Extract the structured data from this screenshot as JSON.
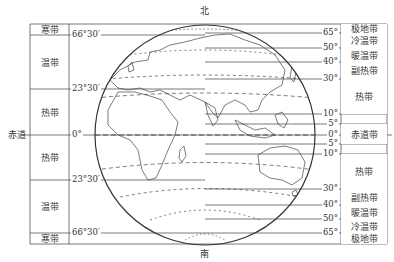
{
  "title": {
    "north": "北",
    "south": "南"
  },
  "equator_label": "赤道",
  "left_table": {
    "lines": [
      {
        "label": "66°30′",
        "y": 35
      },
      {
        "label": "23°30′",
        "y": 89
      },
      {
        "label": "0°",
        "y": 135
      },
      {
        "label": "23°30′",
        "y": 180
      },
      {
        "label": "66°30′",
        "y": 233
      }
    ],
    "zones": [
      {
        "label": "寒带",
        "y0": 24,
        "y1": 35
      },
      {
        "label": "温带",
        "y0": 35,
        "y1": 89
      },
      {
        "label": "热带",
        "y0": 89,
        "y1": 135
      },
      {
        "label": "热带",
        "y0": 135,
        "y1": 180
      },
      {
        "label": "温带",
        "y0": 180,
        "y1": 233
      },
      {
        "label": "寒带",
        "y0": 233,
        "y1": 244
      }
    ]
  },
  "right_table": {
    "lines": [
      {
        "label": "65°",
        "y": 33
      },
      {
        "label": "50°",
        "y": 48
      },
      {
        "label": "40°",
        "y": 62
      },
      {
        "label": "30°",
        "y": 79
      },
      {
        "label": "10°",
        "y": 114
      },
      {
        "label": "5°",
        "y": 124
      },
      {
        "label": "0°",
        "y": 135
      },
      {
        "label": "5°",
        "y": 144
      },
      {
        "label": "10°",
        "y": 154
      },
      {
        "label": "30°",
        "y": 189
      },
      {
        "label": "40°",
        "y": 205
      },
      {
        "label": "50°",
        "y": 219
      },
      {
        "label": "65°",
        "y": 233
      }
    ],
    "zones": [
      {
        "label": "极地带",
        "y0": 24,
        "y1": 33
      },
      {
        "label": "冷温带",
        "y0": 33,
        "y1": 48
      },
      {
        "label": "暖温带",
        "y0": 48,
        "y1": 62
      },
      {
        "label": "副热带",
        "y0": 62,
        "y1": 79
      },
      {
        "label": "热带",
        "y0": 79,
        "y1": 114
      },
      {
        "label": "",
        "y0": 114,
        "y1": 124
      },
      {
        "label": "赤道带",
        "y0": 124,
        "y1": 144
      },
      {
        "label": "",
        "y0": 144,
        "y1": 154
      },
      {
        "label": "热带",
        "y0": 154,
        "y1": 189
      },
      {
        "label": "副热带",
        "y0": 189,
        "y1": 205
      },
      {
        "label": "暖温带",
        "y0": 205,
        "y1": 219
      },
      {
        "label": "冷温带",
        "y0": 219,
        "y1": 233
      },
      {
        "label": "极地带",
        "y0": 233,
        "y1": 244
      }
    ]
  },
  "colors": {
    "line": "#444444",
    "background": "#ffffff"
  }
}
